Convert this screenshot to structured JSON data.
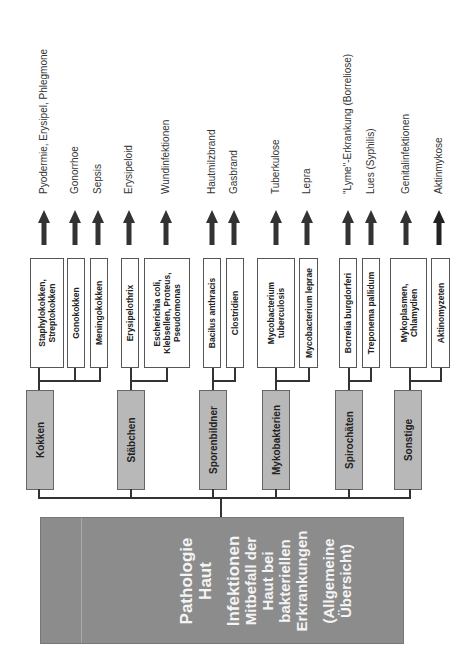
{
  "main": {
    "title_lines": [
      "Pathologie",
      "Haut"
    ],
    "subtitle_lines": [
      "Infektionen",
      "Mitbefall der",
      "Haut bei",
      "bakteriellen",
      "Erkrankungen"
    ],
    "note_lines": [
      "(Allgemeine",
      "Übersicht)"
    ]
  },
  "categories": [
    {
      "label": "Kokken"
    },
    {
      "label": "Stäbchen"
    },
    {
      "label": "Sporenbildner"
    },
    {
      "label": "Mykobakterien"
    },
    {
      "label": "Spirochäten"
    },
    {
      "label": "Sonstige"
    }
  ],
  "species": [
    {
      "lines": [
        "Staphylokokken,",
        "Streptokokken"
      ],
      "category": "Kokken",
      "disease": "Pyodermie, Erysipel, Phlegmone"
    },
    {
      "lines": [
        "Gonokokken"
      ],
      "category": "Kokken",
      "disease": "Gonorrhoe"
    },
    {
      "lines": [
        "Meningokokken"
      ],
      "category": "Kokken",
      "disease": "Sepsis"
    },
    {
      "lines": [
        "Erysipelothrix"
      ],
      "category": "Stäbchen",
      "disease": "Erysipeloid"
    },
    {
      "lines": [
        "Escherichia coli,",
        "Klebsellen, Proteus,",
        "Pseudomonas"
      ],
      "category": "Stäbchen",
      "disease": "Wundinfektionen"
    },
    {
      "lines": [
        "Bacilus anthracis"
      ],
      "category": "Sporenbildner",
      "disease": "Hautmilzbrand"
    },
    {
      "lines": [
        "Clostridien"
      ],
      "category": "Sporenbildner",
      "disease": "Gasbrand"
    },
    {
      "lines": [
        "Mycobacterium",
        "tuberculosis"
      ],
      "category": "Mykobakterien",
      "disease": "Tuberkulose"
    },
    {
      "lines": [
        "Mycobacterium leprae"
      ],
      "category": "Mykobakterien",
      "disease": "Lepra"
    },
    {
      "lines": [
        "Borrelia burgdorferi"
      ],
      "category": "Spirochäten",
      "disease": "\"Lyme\"-Erkrankung (Borreliose)"
    },
    {
      "lines": [
        "Treponema pallidum"
      ],
      "category": "Spirochäten",
      "disease": "Lues (Syphilis)"
    },
    {
      "lines": [
        "Mykoplasmen,",
        "Chlamydien"
      ],
      "category": "Sonstige",
      "disease": "Genitalinfektionen"
    },
    {
      "lines": [
        "Aktinomyzeten"
      ],
      "category": "Sonstige",
      "disease": "Aktinmykose"
    }
  ],
  "colors": {
    "main_box": "#8c8c8c",
    "category_box": "#b8b8b8",
    "species_box": "#ffffff",
    "lines": "#333333",
    "arrow": "#333333"
  }
}
